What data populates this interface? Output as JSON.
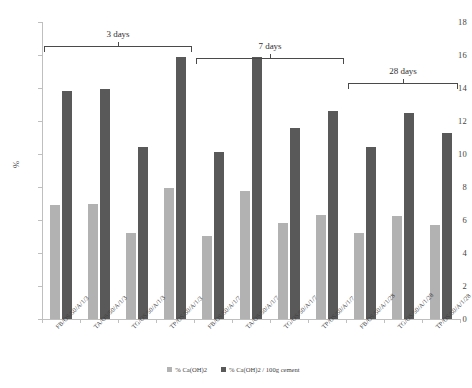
{
  "chart_data": {
    "type": "bar",
    "title": "",
    "xlabel": "",
    "ylabel": "%",
    "ylim": [
      0,
      18
    ],
    "ytick_step": 2,
    "yticks": [
      0,
      2,
      4,
      6,
      8,
      10,
      12,
      14,
      16,
      18
    ],
    "grid": false,
    "legend_position": "bottom-center",
    "categories": [
      "FB/OS/50/A/1/3",
      "TA/OS/50/A/1/3",
      "TG/OS/50/A/1/3",
      "TP/OS/50/A/1/3",
      "FB/OS/50/A/1/7",
      "TA/OS/50/A/1/7",
      "TG/OS/50/A/1/7",
      "TP/OS/50/A/1/7",
      "FB/OS/50/A/1/28",
      "TG/OS/50/A/1/28",
      "TP/OS/50/A/1/28"
    ],
    "series": [
      {
        "name": "% Ca(OH)2",
        "color": "#b2b2b2",
        "values": [
          6.9,
          7.0,
          5.2,
          7.95,
          5.05,
          7.75,
          5.8,
          6.3,
          5.2,
          6.25,
          5.7
        ]
      },
      {
        "name": "% Ca(OH)2 / 100g cement",
        "color": "#595959",
        "values": [
          13.8,
          13.95,
          10.4,
          15.9,
          10.1,
          15.9,
          11.55,
          12.6,
          10.4,
          12.5,
          11.3
        ]
      }
    ],
    "annotations": [
      {
        "label": "3 days",
        "start_category": 0,
        "end_category": 3
      },
      {
        "label": "7 days",
        "start_category": 4,
        "end_category": 7
      },
      {
        "label": "28 days",
        "start_category": 8,
        "end_category": 10
      }
    ]
  },
  "colors": {
    "series_a": "#b2b2b2",
    "series_b": "#595959",
    "axis": "#bfbfbf",
    "text": "#3f3f3f",
    "bracket": "#4a4a4a",
    "background": "#ffffff"
  }
}
